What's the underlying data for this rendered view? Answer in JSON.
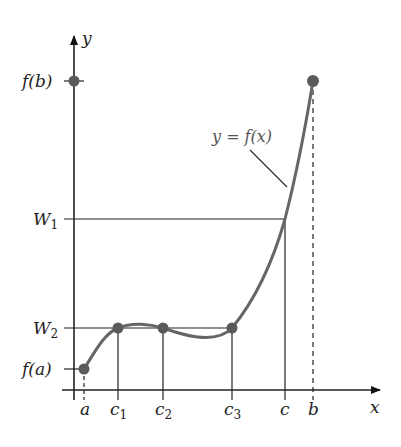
{
  "diagram": {
    "axes": {
      "x_label": "x",
      "y_label": "y"
    },
    "y_ticks": [
      {
        "id": "fb",
        "label": "f(b)"
      },
      {
        "id": "w1",
        "label": "W",
        "sub": "1"
      },
      {
        "id": "w2",
        "label": "W",
        "sub": "2"
      },
      {
        "id": "fa",
        "label": "f(a)"
      }
    ],
    "x_ticks": [
      {
        "id": "a",
        "label": "a"
      },
      {
        "id": "c1",
        "label": "c",
        "sub": "1"
      },
      {
        "id": "c2",
        "label": "c",
        "sub": "2"
      },
      {
        "id": "c3",
        "label": "c",
        "sub": "3"
      },
      {
        "id": "c",
        "label": "c"
      },
      {
        "id": "b",
        "label": "b"
      }
    ],
    "curve_label": "y = f(x)",
    "colors": {
      "axis": "#222222",
      "curve": "#666666",
      "point": "#5a5a5a"
    }
  }
}
